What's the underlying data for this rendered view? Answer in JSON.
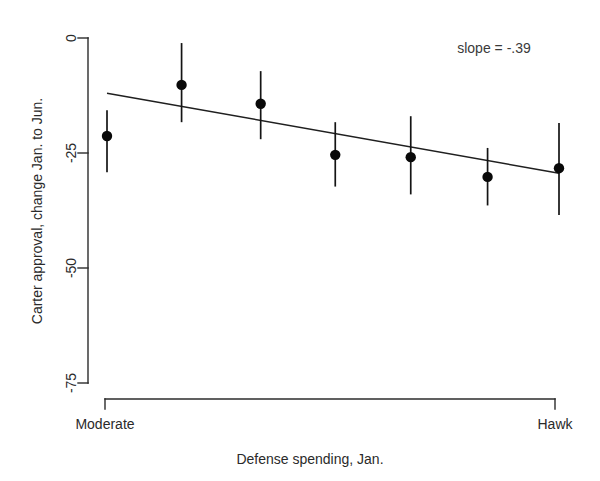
{
  "chart_data": {
    "type": "scatter",
    "title": "",
    "xlabel": "Defense spending, Jan.",
    "ylabel": "Carter approval, change Jan. to Jun.",
    "ylim": [
      -75,
      0
    ],
    "yticks": [
      0,
      -25,
      -50,
      -75
    ],
    "ytick_labels": [
      "0",
      "-25",
      "-50",
      "-75"
    ],
    "xlim": [
      0,
      1
    ],
    "xtick_labels": [
      "Moderate",
      "Hawk"
    ],
    "grid": false,
    "legend": false,
    "annotations": [
      {
        "text": "slope = -.39",
        "x": 0.78,
        "y": -5
      }
    ],
    "x": [
      0.0,
      0.165,
      0.34,
      0.505,
      0.672,
      0.842,
      1.0
    ],
    "values": [
      -21.3,
      -10.2,
      -14.3,
      -25.4,
      -25.9,
      -30.2,
      -28.3
    ],
    "errors_low": [
      -29.2,
      -18.3,
      -22.0,
      -32.3,
      -34.0,
      -36.4,
      -38.5
    ],
    "errors_high": [
      -15.7,
      -1.1,
      -7.2,
      -18.3,
      -17.0,
      -23.9,
      -18.5
    ],
    "fit_line": {
      "label": "linear fit",
      "slope_text": "-.39",
      "x_start": 0.0,
      "y_start": -12.0,
      "x_end": 1.0,
      "y_end": -29.4
    },
    "series_name": "Carter approval change"
  },
  "axis": {
    "y_title": "Carter approval, change Jan. to Jun.",
    "x_title": "Defense spending, Jan.",
    "y_tick_0": "0",
    "y_tick_25": "-25",
    "y_tick_50": "-50",
    "y_tick_75": "-75",
    "x_cat_left": "Moderate",
    "x_cat_right": "Hawk"
  },
  "annotation": {
    "slope_text": "slope = -.39"
  },
  "colors": {
    "background": "#ffffff",
    "ink": "#1a1a1a",
    "point": "#090909",
    "line": "#1f1f1f",
    "axis": "#2b2b2b"
  }
}
